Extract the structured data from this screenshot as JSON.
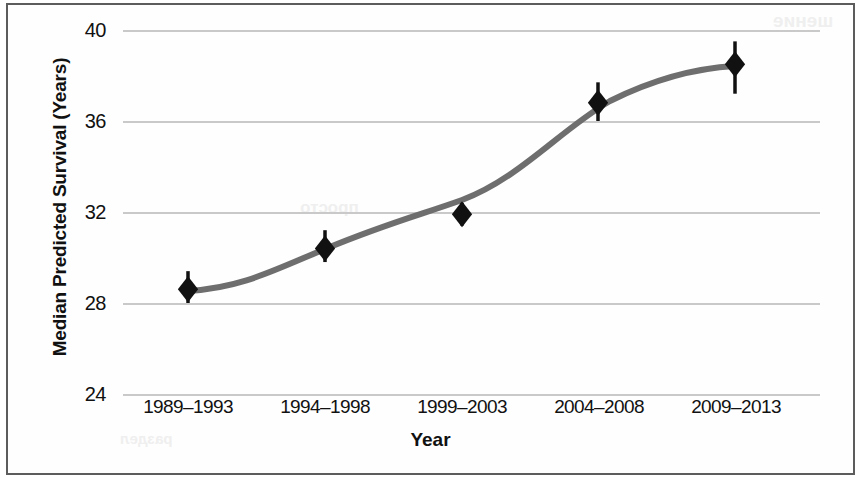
{
  "chart_data": {
    "type": "scatter",
    "title": "",
    "xlabel": "Year",
    "ylabel": "Median Predicted Survival (Years)",
    "categories": [
      "1989–1993",
      "1994–1998",
      "1999–2003",
      "2004–2008",
      "2009–2013"
    ],
    "values": [
      28.6,
      30.4,
      31.9,
      36.8,
      38.5
    ],
    "error_low": [
      28.0,
      29.8,
      31.4,
      36.0,
      37.2
    ],
    "error_high": [
      29.4,
      31.2,
      32.4,
      37.7,
      39.5
    ],
    "ylim": [
      24,
      40
    ],
    "yticks": [
      24,
      28,
      32,
      36,
      40
    ],
    "ytick_labels": [
      "24",
      "28",
      "32",
      "36",
      "40"
    ],
    "grid": true,
    "legend": "none",
    "marker": "diamond",
    "marker_color": "#111111",
    "errorbar_color": "#111111",
    "fit_curve": {
      "label": "fitted trend",
      "color": "#6e6e6e",
      "style": "solid",
      "width": 6
    }
  },
  "colors": {
    "grid": "#c9c9c9",
    "axis_text": "#111111",
    "frame": "#5c5c5c",
    "background": "#ffffff"
  },
  "bleed_text": {
    "line1": "шение",
    "line2": "просто",
    "line3": "раздел"
  }
}
